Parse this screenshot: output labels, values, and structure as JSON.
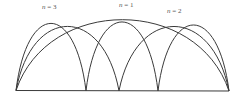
{
  "diagram": {
    "labels": {
      "n3": {
        "var": "n",
        "eq": " = 3"
      },
      "n1": {
        "var": "n",
        "eq": " = 1"
      },
      "n2": {
        "var": "n",
        "eq": " = 2"
      }
    },
    "colors": {
      "stroke": "#3a3a3a",
      "label": "#555555",
      "background": "#ffffff"
    },
    "string": {
      "x_start": 16,
      "x_end": 229,
      "y": 91
    },
    "modes": [
      {
        "n": 1,
        "nodes": [
          16,
          229
        ],
        "peak_y": 13
      },
      {
        "n": 2,
        "nodes": [
          16,
          119,
          229
        ],
        "peak_y": 18
      },
      {
        "n": 3,
        "nodes": [
          16,
          86,
          158,
          229
        ],
        "peak_y": 16
      }
    ]
  }
}
